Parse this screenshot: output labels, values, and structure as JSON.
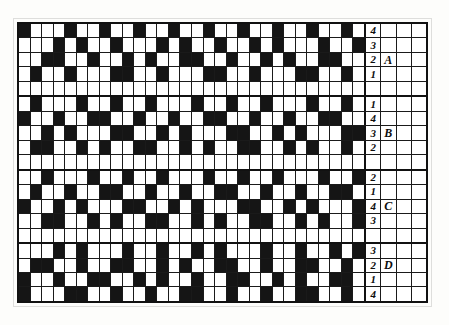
{
  "figure": {
    "kind": "weaving-draft-grid",
    "colors": {
      "filled": "#151515",
      "empty": "#ffffff",
      "rule": "#1a1a1a",
      "border": "#111111"
    },
    "columns_pattern": 30,
    "columns_label": 4,
    "rows": 19
  },
  "chart_data": {
    "type": "heatmap",
    "title": "",
    "xlabel": "",
    "ylabel": "",
    "grid": true,
    "legend": "none",
    "note": "Binary weaving draft: 1 = filled (dark) square, 0 = blank (white) square. 19 rows x 30 pattern columns, followed by 4 label columns.",
    "row_labels": [
      "4",
      "3",
      "2",
      "1",
      "",
      "1",
      "4",
      "3",
      "2",
      "",
      "2",
      "1",
      "4",
      "3",
      "",
      "3",
      "2",
      "1",
      "4"
    ],
    "block_labels": [
      "",
      "",
      "A",
      "",
      "",
      "",
      "",
      "B",
      "",
      "",
      "",
      "",
      "C",
      "",
      "",
      "",
      "D",
      "",
      ""
    ],
    "values": [
      [
        1,
        0,
        0,
        0,
        1,
        0,
        0,
        1,
        0,
        0,
        1,
        0,
        0,
        1,
        0,
        0,
        1,
        0,
        0,
        1,
        0,
        0,
        1,
        0,
        0,
        1,
        0,
        0,
        1,
        0
      ],
      [
        0,
        0,
        0,
        1,
        0,
        1,
        0,
        0,
        1,
        0,
        0,
        0,
        1,
        0,
        1,
        0,
        0,
        1,
        0,
        0,
        1,
        0,
        1,
        0,
        0,
        0,
        1,
        0,
        0,
        1
      ],
      [
        0,
        0,
        1,
        1,
        0,
        0,
        1,
        0,
        0,
        1,
        0,
        1,
        0,
        0,
        1,
        1,
        0,
        0,
        1,
        0,
        0,
        1,
        0,
        1,
        0,
        0,
        1,
        1,
        0,
        0
      ],
      [
        0,
        1,
        0,
        0,
        1,
        0,
        0,
        0,
        1,
        1,
        0,
        0,
        1,
        0,
        0,
        0,
        1,
        1,
        0,
        0,
        1,
        0,
        0,
        0,
        1,
        1,
        0,
        0,
        1,
        0
      ],
      [
        0,
        0,
        0,
        0,
        0,
        0,
        0,
        0,
        0,
        0,
        0,
        0,
        0,
        0,
        0,
        0,
        0,
        0,
        0,
        0,
        0,
        0,
        0,
        0,
        0,
        0,
        0,
        0,
        0,
        0
      ],
      [
        0,
        1,
        0,
        0,
        0,
        1,
        0,
        0,
        1,
        0,
        0,
        1,
        0,
        0,
        0,
        1,
        0,
        0,
        1,
        0,
        0,
        1,
        0,
        0,
        0,
        1,
        0,
        0,
        1,
        0
      ],
      [
        1,
        0,
        0,
        1,
        0,
        0,
        1,
        1,
        0,
        0,
        1,
        0,
        0,
        1,
        0,
        0,
        1,
        1,
        0,
        0,
        1,
        0,
        0,
        1,
        0,
        0,
        1,
        1,
        0,
        0
      ],
      [
        0,
        0,
        1,
        0,
        1,
        0,
        0,
        0,
        1,
        1,
        0,
        0,
        1,
        0,
        1,
        0,
        0,
        0,
        1,
        1,
        0,
        0,
        1,
        0,
        1,
        0,
        0,
        0,
        1,
        1
      ],
      [
        0,
        1,
        1,
        0,
        0,
        1,
        0,
        1,
        0,
        0,
        1,
        1,
        0,
        0,
        1,
        0,
        1,
        0,
        0,
        1,
        1,
        0,
        0,
        1,
        0,
        1,
        0,
        0,
        1,
        0
      ],
      [
        0,
        0,
        0,
        0,
        0,
        0,
        0,
        0,
        0,
        0,
        0,
        0,
        0,
        0,
        0,
        0,
        0,
        0,
        0,
        0,
        0,
        0,
        0,
        0,
        0,
        0,
        0,
        0,
        0,
        0
      ],
      [
        0,
        0,
        1,
        0,
        0,
        0,
        1,
        0,
        0,
        1,
        0,
        0,
        1,
        0,
        0,
        0,
        1,
        0,
        0,
        1,
        0,
        0,
        1,
        0,
        0,
        0,
        1,
        0,
        0,
        1
      ],
      [
        0,
        1,
        0,
        0,
        1,
        0,
        0,
        1,
        1,
        0,
        0,
        1,
        0,
        0,
        1,
        0,
        0,
        1,
        1,
        0,
        0,
        1,
        0,
        0,
        1,
        0,
        0,
        1,
        1,
        0
      ],
      [
        1,
        0,
        0,
        1,
        0,
        1,
        0,
        0,
        0,
        1,
        1,
        0,
        0,
        1,
        0,
        1,
        0,
        0,
        0,
        1,
        1,
        0,
        0,
        1,
        0,
        1,
        0,
        0,
        0,
        1
      ],
      [
        0,
        0,
        1,
        1,
        0,
        0,
        1,
        0,
        1,
        0,
        0,
        1,
        1,
        0,
        0,
        1,
        0,
        1,
        0,
        0,
        1,
        1,
        0,
        0,
        1,
        0,
        1,
        0,
        0,
        1
      ],
      [
        0,
        0,
        0,
        0,
        0,
        0,
        0,
        0,
        0,
        0,
        0,
        0,
        0,
        0,
        0,
        0,
        0,
        0,
        0,
        0,
        0,
        0,
        0,
        0,
        0,
        0,
        0,
        0,
        0,
        0
      ],
      [
        0,
        0,
        0,
        1,
        0,
        1,
        0,
        0,
        0,
        1,
        0,
        0,
        1,
        0,
        0,
        1,
        0,
        1,
        0,
        0,
        0,
        1,
        0,
        0,
        1,
        0,
        0,
        1,
        0,
        1
      ],
      [
        0,
        1,
        1,
        0,
        0,
        1,
        0,
        0,
        1,
        1,
        0,
        0,
        1,
        0,
        1,
        0,
        0,
        1,
        1,
        0,
        0,
        1,
        0,
        0,
        1,
        1,
        0,
        0,
        1,
        0
      ],
      [
        1,
        0,
        0,
        1,
        0,
        0,
        1,
        1,
        0,
        0,
        1,
        0,
        1,
        0,
        0,
        1,
        0,
        0,
        1,
        1,
        0,
        0,
        1,
        0,
        1,
        0,
        0,
        1,
        1,
        0
      ],
      [
        1,
        0,
        0,
        0,
        1,
        1,
        0,
        0,
        1,
        0,
        0,
        1,
        0,
        0,
        1,
        1,
        0,
        0,
        1,
        0,
        0,
        1,
        0,
        0,
        1,
        1,
        0,
        0,
        1,
        0
      ]
    ]
  },
  "band_boundaries": [
    4,
    9,
    14
  ]
}
